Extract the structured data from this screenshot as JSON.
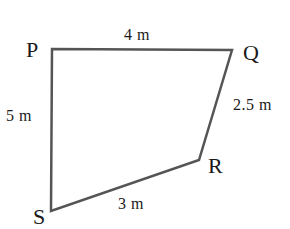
{
  "diagram": {
    "shape": "quadrilateral",
    "stroke_color": "#555555",
    "vertices": [
      {
        "name": "P",
        "x": 52,
        "y": 49
      },
      {
        "name": "Q",
        "x": 232,
        "y": 50
      },
      {
        "name": "R",
        "x": 199,
        "y": 160
      },
      {
        "name": "S",
        "x": 51,
        "y": 211
      }
    ],
    "vertex_labels": {
      "P": "P",
      "Q": "Q",
      "R": "R",
      "S": "S"
    },
    "sides": {
      "PQ": "4  m",
      "QR": "2.5  m",
      "RS": "3  m",
      "SP": "5  m"
    }
  }
}
